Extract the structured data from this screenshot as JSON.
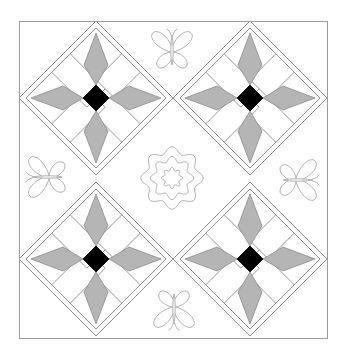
{
  "diagram": {
    "canvas": {
      "width": 346,
      "height": 363,
      "background": "#ffffff"
    },
    "outer_square": {
      "x": 19.5,
      "y": 21.5,
      "width": 308,
      "height": 317,
      "stroke": "#9a9a9a"
    },
    "colors": {
      "kite_fill": "#b5b5b5",
      "center_fill": "#000000",
      "strip_fill": "#ffffff",
      "line": "#8c8c8c",
      "motif_line": "#a6a6a6"
    },
    "blocks": [
      {
        "name": "star-block-top-left",
        "cx": 96,
        "cy": 98
      },
      {
        "name": "star-block-top-right",
        "cx": 250,
        "cy": 98
      },
      {
        "name": "star-block-bottom-left",
        "cx": 96,
        "cy": 259
      },
      {
        "name": "star-block-bottom-right",
        "cx": 250,
        "cy": 259
      }
    ],
    "block_geometry": {
      "outer_half_diagonal": 77,
      "inner_frame_half_diagonal": 70,
      "star_tip_distance": 65,
      "center_half_diagonal": 13,
      "strip_half_width": 13,
      "kite_width_distance": 33,
      "kite_half_width": 12
    },
    "medallion": {
      "name": "wavy-flower-medallion",
      "cx": 172,
      "cy": 178,
      "rings": [
        {
          "radius": 28,
          "amplitude": 3.2,
          "waves": 8
        },
        {
          "radius": 19,
          "amplitude": 2.6,
          "waves": 8
        },
        {
          "radius": 9,
          "amplitude": 1.6,
          "waves": 8
        }
      ]
    },
    "butterflies": [
      {
        "name": "butterfly-top",
        "cx": 172,
        "cy": 50,
        "rotation": 0
      },
      {
        "name": "butterfly-left",
        "cx": 47,
        "cy": 177,
        "rotation": -90
      },
      {
        "name": "butterfly-right",
        "cx": 298,
        "cy": 180,
        "rotation": 90
      },
      {
        "name": "butterfly-bottom",
        "cx": 174,
        "cy": 309,
        "rotation": 180
      }
    ]
  }
}
